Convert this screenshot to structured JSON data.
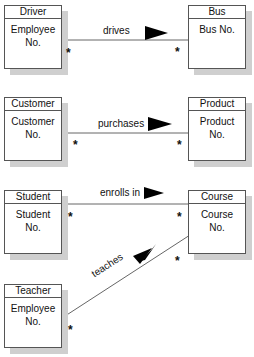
{
  "diagram": {
    "type": "class-diagram",
    "relationships": [
      {
        "left": {
          "name": "Driver",
          "attribute": "Employee No."
        },
        "right": {
          "name": "Bus",
          "attribute": "Bus No."
        },
        "label": "drives",
        "left_multiplicity": "*",
        "right_multiplicity": "*"
      },
      {
        "left": {
          "name": "Customer",
          "attribute": "Customer No."
        },
        "right": {
          "name": "Product",
          "attribute": "Product No."
        },
        "label": "purchases",
        "left_multiplicity": "*",
        "right_multiplicity": "*"
      },
      {
        "left": {
          "name": "Student",
          "attribute": "Student No."
        },
        "right": {
          "name": "Course",
          "attribute": "Course No."
        },
        "label": "enrolls in",
        "left_multiplicity": "*",
        "right_multiplicity": "*"
      },
      {
        "left": {
          "name": "Teacher",
          "attribute": "Employee No."
        },
        "right": {
          "name": "Course",
          "attribute": "Course No."
        },
        "label": "teaches",
        "left_multiplicity": "*",
        "right_multiplicity": "*"
      }
    ]
  },
  "entities": {
    "driver": {
      "title": "Driver",
      "attr1": "Employee",
      "attr2": "No."
    },
    "bus": {
      "title": "Bus",
      "attr1": "Bus No."
    },
    "customer": {
      "title": "Customer",
      "attr1": "Customer",
      "attr2": "No."
    },
    "product": {
      "title": "Product",
      "attr1": "Product",
      "attr2": "No."
    },
    "student": {
      "title": "Student",
      "attr1": "Student",
      "attr2": "No."
    },
    "course": {
      "title": "Course",
      "attr1": "Course",
      "attr2": "No."
    },
    "teacher": {
      "title": "Teacher",
      "attr1": "Employee",
      "attr2": "No."
    }
  },
  "labels": {
    "drives": "drives",
    "purchases": "purchases",
    "enrolls": "enrolls in",
    "teaches": "teaches"
  },
  "multiplicity": "*",
  "colors": {
    "line": "#666666",
    "border": "#555555",
    "shadow": "#cfcfcf",
    "arrow": "#000000"
  }
}
